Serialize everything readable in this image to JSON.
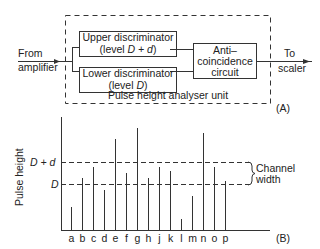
{
  "diagram_a": {
    "panel_label": "(A)",
    "input_label_line1": "From",
    "input_label_line2": "amplifier",
    "output_label_line1": "To",
    "output_label_line2": "scaler",
    "unit_label": "Pulse height analyser unit",
    "upper_discriminator": {
      "line1": "Upper discriminator",
      "line2_prefix": "(level ",
      "line2_var": "D + d",
      "line2_suffix": ")"
    },
    "lower_discriminator": {
      "line1": "Lower discriminator",
      "line2_prefix": "(level ",
      "line2_var": "D",
      "line2_suffix": ")"
    },
    "anti_coincidence": {
      "line1": "Anti–",
      "line2": "coincidence",
      "line3": "circuit"
    }
  },
  "chart_data": {
    "type": "bar",
    "panel_label": "(B)",
    "title": "",
    "xlabel": "",
    "ylabel": "Pulse height",
    "categories": [
      "a",
      "b",
      "c",
      "d",
      "e",
      "f",
      "g",
      "h",
      "j",
      "k",
      "l",
      "m",
      "n",
      "o",
      "p"
    ],
    "values": [
      23,
      52,
      63,
      40,
      91,
      57,
      102,
      52,
      63,
      59,
      11,
      34,
      97,
      63,
      49
    ],
    "reference_lines": [
      {
        "label": "D + d",
        "value": 68,
        "style": "dashed"
      },
      {
        "label": "D",
        "value": 46,
        "style": "dashed"
      }
    ],
    "annotation": {
      "text_line1": "Channel",
      "text_line2": "width",
      "spans": [
        "D",
        "D + d"
      ]
    },
    "ylim": [
      0,
      113
    ],
    "grid": false,
    "legend": "none"
  }
}
